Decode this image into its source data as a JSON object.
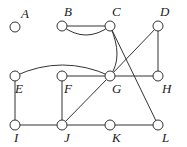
{
  "diagram": {
    "type": "graph",
    "nodes": [
      {
        "id": "A",
        "label": "A",
        "x": 15,
        "y": 27,
        "lx": 21,
        "ly": 18
      },
      {
        "id": "B",
        "label": "B",
        "x": 62,
        "y": 26,
        "lx": 64,
        "ly": 16
      },
      {
        "id": "C",
        "label": "C",
        "x": 110,
        "y": 26,
        "lx": 112,
        "ly": 16
      },
      {
        "id": "D",
        "label": "D",
        "x": 158,
        "y": 26,
        "lx": 160,
        "ly": 16
      },
      {
        "id": "E",
        "label": "E",
        "x": 15,
        "y": 76,
        "lx": 15,
        "ly": 93
      },
      {
        "id": "F",
        "label": "F",
        "x": 62,
        "y": 76,
        "lx": 64,
        "ly": 93
      },
      {
        "id": "G",
        "label": "G",
        "x": 110,
        "y": 76,
        "lx": 112,
        "ly": 93
      },
      {
        "id": "H",
        "label": "H",
        "x": 158,
        "y": 76,
        "lx": 162,
        "ly": 93
      },
      {
        "id": "I",
        "label": "I",
        "x": 15,
        "y": 125,
        "lx": 14,
        "ly": 142
      },
      {
        "id": "J",
        "label": "J",
        "x": 62,
        "y": 125,
        "lx": 64,
        "ly": 142
      },
      {
        "id": "K",
        "label": "K",
        "x": 110,
        "y": 125,
        "lx": 112,
        "ly": 142
      },
      {
        "id": "L",
        "label": "L",
        "x": 158,
        "y": 125,
        "lx": 162,
        "ly": 142
      }
    ],
    "edges": [
      {
        "from": "B",
        "to": "C",
        "kind": "line"
      },
      {
        "from": "B",
        "to": "C",
        "kind": "curve"
      },
      {
        "from": "C",
        "to": "G",
        "kind": "curve"
      },
      {
        "from": "C",
        "to": "L",
        "kind": "line"
      },
      {
        "from": "D",
        "to": "G",
        "kind": "line"
      },
      {
        "from": "D",
        "to": "H",
        "kind": "line"
      },
      {
        "from": "E",
        "to": "G",
        "kind": "curve"
      },
      {
        "from": "E",
        "to": "I",
        "kind": "line"
      },
      {
        "from": "F",
        "to": "G",
        "kind": "line"
      },
      {
        "from": "F",
        "to": "J",
        "kind": "line"
      },
      {
        "from": "G",
        "to": "H",
        "kind": "line"
      },
      {
        "from": "G",
        "to": "J",
        "kind": "line"
      },
      {
        "from": "I",
        "to": "J",
        "kind": "line"
      },
      {
        "from": "J",
        "to": "K",
        "kind": "line"
      },
      {
        "from": "K",
        "to": "L",
        "kind": "line"
      }
    ]
  }
}
